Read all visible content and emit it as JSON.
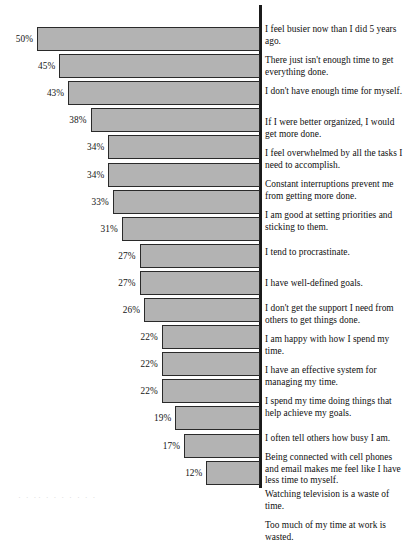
{
  "figure": {
    "axis_color": "#1b1b1b",
    "bar_fill": "#b3b3b3",
    "bar_stroke": "#2a2a2a",
    "background": "#ffffff",
    "bleed_text": "· ·   ··          ·    ·        · ·        · ·      ·"
  },
  "chart_data": {
    "type": "bar",
    "orientation": "horizontal",
    "title": "",
    "subtitle": "",
    "xlabel": "",
    "ylabel": "",
    "xlim": [
      0,
      50
    ],
    "grid": false,
    "legend": false,
    "value_suffix": "%",
    "categories": [
      "I feel busier now than I did 5 years ago.",
      "There just isn't enough time to get everything done.",
      "I don't have enough time for myself.",
      "If I were better organized, I would get more done.",
      "I feel overwhelmed by all the tasks I need to accomplish.",
      "Constant interruptions prevent me from getting more done.",
      "I am good at setting priorities and sticking to them.",
      "I tend to procrastinate.",
      "I have well-defined goals.",
      "I don't get the support I need from others to get things done.",
      "I am happy with how I spend my time.",
      "I have an effective system for managing my time.",
      "I spend my time doing things that help achieve my goals.",
      "I often tell others how busy I am.",
      "Being connected with cell phones and email makes me feel like I have less time to myself.",
      "Watching television is a waste of time.",
      "Too much of my time at work is wasted."
    ],
    "values": [
      50,
      45,
      43,
      38,
      34,
      34,
      33,
      31,
      27,
      27,
      26,
      22,
      22,
      22,
      19,
      17,
      12
    ],
    "value_labels": [
      "50%",
      "45%",
      "43%",
      "38%",
      "34%",
      "34%",
      "33%",
      "31%",
      "27%",
      "27%",
      "26%",
      "22%",
      "22%",
      "22%",
      "19%",
      "17%",
      "12%"
    ]
  },
  "rows": [
    {
      "value_label": "50%",
      "statement": "I feel busier now than I did 5 years ago.",
      "bar_top": 27,
      "bar_height": 28,
      "bar_left": 36,
      "pct_top": 36,
      "pct_right": 34,
      "text_top": 24
    },
    {
      "value_label": "45%",
      "statement": "There just isn't enough time to get everything done.",
      "bar_top": 58,
      "bar_height": 28,
      "bar_left": 57,
      "pct_top": 67,
      "pct_right": 55,
      "text_top": 55
    },
    {
      "value_label": "43%",
      "statement": "I don't have enough time for myself.",
      "bar_top": 89,
      "bar_height": 28,
      "bar_left": 65,
      "pct_top": 98,
      "pct_right": 63,
      "text_top": 86
    },
    {
      "value_label": "38%",
      "statement": "If I were better organized, I would get more done.",
      "bar_top": 120,
      "bar_height": 28,
      "bar_left": 86,
      "pct_top": 129,
      "pct_right": 84,
      "text_top": 117
    },
    {
      "value_label": "34%",
      "statement": "I feel overwhelmed by all the tasks I need to accomplish.",
      "bar_top": 151,
      "bar_height": 28,
      "bar_left": 103,
      "pct_top": 160,
      "pct_right": 101,
      "text_top": 148
    },
    {
      "value_label": "34%",
      "statement": "Constant interruptions prevent me from getting more done.",
      "bar_top": 182,
      "bar_height": 28,
      "bar_left": 103,
      "pct_top": 191,
      "pct_right": 101,
      "text_top": 179
    },
    {
      "value_label": "33%",
      "statement": "I am good at setting priorities and sticking to them.",
      "bar_top": 213,
      "bar_height": 28,
      "bar_left": 107,
      "pct_top": 222,
      "pct_right": 105,
      "text_top": 210
    },
    {
      "value_label": "31%",
      "statement": "I tend to procrastinate.",
      "bar_top": 244,
      "bar_height": 28,
      "bar_left": 116,
      "pct_top": 253,
      "pct_right": 114,
      "text_top": 247
    },
    {
      "value_label": "27%",
      "statement": "I have well-defined goals.",
      "bar_top": 275,
      "bar_height": 28,
      "bar_left": 133,
      "pct_top": 284,
      "pct_right": 131,
      "text_top": 278
    },
    {
      "value_label": "27%",
      "statement": "I don't get the support I need from others to get things done.",
      "bar_top": 306,
      "bar_height": 28,
      "bar_left": 133,
      "pct_top": 315,
      "pct_right": 131,
      "text_top": 303
    },
    {
      "value_label": "26%",
      "statement": "I am happy with how I spend my time.",
      "bar_top": 337,
      "bar_height": 28,
      "bar_left": 138,
      "pct_top": 346,
      "pct_right": 136,
      "text_top": 334
    },
    {
      "value_label": "22%",
      "statement": "I have an effective system for managing my time.",
      "bar_top": 368,
      "bar_height": 28,
      "bar_left": 155,
      "pct_top": 377,
      "pct_right": 153,
      "text_top": 365
    },
    {
      "value_label": "22%",
      "statement": "I spend my time doing things that help achieve my goals.",
      "bar_top": 399,
      "bar_height": 28,
      "bar_left": 155,
      "pct_top": 408,
      "pct_right": 153,
      "text_top": 396
    },
    {
      "value_label": "22%",
      "statement": "I often tell others how busy I am.",
      "bar_top": 430,
      "bar_height": 28,
      "bar_left": 155,
      "pct_top": 439,
      "pct_right": 153,
      "text_top": 433
    },
    {
      "value_label": "19%",
      "statement": "Being connected with cell phones and email makes me feel like I have less time to myself.",
      "bar_top": 461,
      "bar_height": 28,
      "bar_left": 168,
      "pct_top": 470,
      "pct_right": 166,
      "text_top": 452
    },
    {
      "value_label": "17%",
      "statement": "Watching television is a waste of time.",
      "bar_top": 492,
      "bar_height": 28,
      "bar_left": 177,
      "pct_top": 501,
      "pct_right": 175,
      "text_top": 489
    },
    {
      "value_label": "12%",
      "statement": "Too much of my time at work is wasted.",
      "bar_top": 523,
      "bar_height": 28,
      "bar_left": 198,
      "pct_top": 532,
      "pct_right": 196,
      "text_top": 520
    }
  ]
}
